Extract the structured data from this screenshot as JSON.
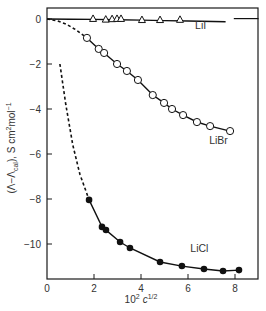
{
  "chart_data": {
    "type": "scatter",
    "title": "",
    "xlabel": "10² c¹ᐟ²",
    "xlabel_parts": {
      "base": "10",
      "base_sup": "2",
      "var": "c",
      "var_sup": "1/2"
    },
    "ylabel": "(Λ−Λ_cal), S cm²mol⁻¹",
    "ylabel_parts": {
      "pre": "(Λ−Λ",
      "sub": "cal",
      "post": "), S cm",
      "sup1": "2",
      "mid": "mol",
      "sup2": "−1"
    },
    "xlim": [
      0,
      9
    ],
    "ylim": [
      -11.7,
      0.25
    ],
    "xticks": [
      0,
      2,
      4,
      6,
      8
    ],
    "xtick_labels": [
      "0",
      "2",
      "4",
      "6",
      "8"
    ],
    "yticks": [
      0,
      -2,
      -4,
      -6,
      -8,
      -10
    ],
    "ytick_labels": [
      "0",
      "−2",
      "−4",
      "−6",
      "−8",
      "−10"
    ],
    "grid": false,
    "legend": "inline labels",
    "series": [
      {
        "name": "LiI",
        "label": "LiI",
        "marker": "open-triangle",
        "x": [
          1.96,
          2.5,
          2.77,
          2.98,
          3.15,
          4.04,
          4.81,
          5.66
        ],
        "y": [
          -0.01,
          -0.04,
          -0.02,
          -0.01,
          -0.01,
          -0.06,
          -0.06,
          -0.05
        ],
        "fit_line": {
          "x": [
            0,
            1.0,
            2.0,
            3.0,
            4.0,
            5.0,
            6.0,
            7.6
          ],
          "y": [
            0.0,
            -0.01,
            -0.02,
            -0.03,
            -0.05,
            -0.07,
            -0.09,
            -0.12
          ],
          "style": "solid"
        },
        "extra_segment": {
          "x": [
            7.95,
            9.0
          ],
          "y": [
            0.02,
            0.02
          ],
          "style": "solid"
        },
        "label_pos": {
          "x": 6.3,
          "y": -0.45
        }
      },
      {
        "name": "LiBr",
        "label": "LiBr",
        "marker": "open-circle",
        "x": [
          1.7,
          2.2,
          2.43,
          2.98,
          3.4,
          3.87,
          4.5,
          4.98,
          5.32,
          5.79,
          6.38,
          6.94,
          7.79
        ],
        "y": [
          -0.84,
          -1.33,
          -1.51,
          -2.0,
          -2.31,
          -2.71,
          -3.38,
          -3.73,
          -4.0,
          -4.27,
          -4.58,
          -4.76,
          -4.98
        ],
        "dashed_extrapolation": {
          "x": [
            0,
            0.4,
            0.8,
            1.2,
            1.7
          ],
          "y": [
            0.0,
            -0.07,
            -0.22,
            -0.46,
            -0.84
          ]
        },
        "label_pos": {
          "x": 6.9,
          "y": -5.55
        }
      },
      {
        "name": "LiCl",
        "label": "LiCl",
        "marker": "filled-circle",
        "x": [
          1.79,
          2.34,
          2.51,
          3.11,
          3.53,
          4.81,
          5.74,
          6.68,
          7.49,
          8.17
        ],
        "y": [
          -8.04,
          -9.24,
          -9.38,
          -9.91,
          -10.18,
          -10.8,
          -10.98,
          -11.11,
          -11.2,
          -11.16
        ],
        "dashed_extrapolation": {
          "x": [
            0.55,
            0.8,
            1.1,
            1.4,
            1.79
          ],
          "y": [
            -2.0,
            -3.8,
            -5.6,
            -6.9,
            -8.04
          ]
        },
        "label_pos": {
          "x": 6.1,
          "y": -10.35
        }
      }
    ]
  },
  "colors": {
    "axis": "#1a1a1a",
    "line": "#111111",
    "text": "#333333",
    "marker_fill_open": "#ffffff",
    "marker_fill_solid": "#111111",
    "background": "#ffffff"
  }
}
